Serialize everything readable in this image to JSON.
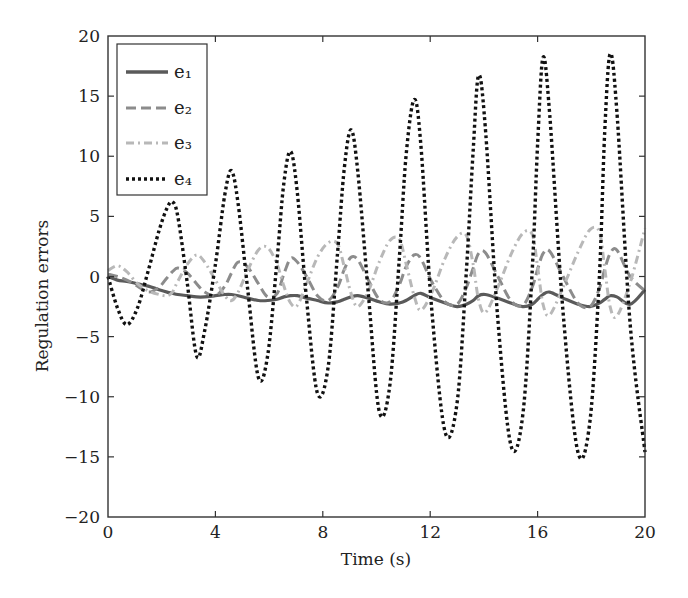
{
  "chart_data": {
    "type": "line",
    "title": "",
    "xlabel": "Time (s)",
    "ylabel": "Regulation errors",
    "xlim": [
      0,
      20
    ],
    "ylim": [
      -20,
      20
    ],
    "xticks": [
      0,
      4,
      8,
      12,
      16,
      20
    ],
    "yticks": [
      -20,
      -15,
      -10,
      -5,
      0,
      5,
      10,
      15,
      20
    ],
    "grid": false,
    "legend_position": "upper left",
    "x": [
      0,
      0.35,
      0.7,
      1.1,
      1.5,
      1.9,
      2.2,
      2.4,
      2.6,
      2.95,
      3.3,
      3.6,
      4.0,
      4.35,
      4.6,
      4.85,
      5.2,
      5.6,
      5.95,
      6.3,
      6.55,
      6.8,
      7.05,
      7.4,
      7.8,
      8.2,
      8.55,
      8.8,
      9.05,
      9.3,
      9.7,
      10.1,
      10.5,
      10.85,
      11.1,
      11.4,
      11.65,
      12.05,
      12.55,
      13.0,
      13.35,
      13.6,
      13.8,
      14.05,
      14.5,
      15.0,
      15.45,
      15.8,
      16.0,
      16.2,
      16.45,
      16.95,
      17.5,
      17.95,
      18.3,
      18.5,
      18.7,
      18.95,
      19.45,
      20.0
    ],
    "series": [
      {
        "name": "e1",
        "label": "e₁",
        "color": "#5a5a5a",
        "dash": "solid",
        "values": [
          0,
          -0.3,
          -0.4,
          -0.6,
          -0.8,
          -1.1,
          -1.3,
          -1.4,
          -1.5,
          -1.6,
          -1.7,
          -1.7,
          -1.6,
          -1.5,
          -1.5,
          -1.6,
          -1.8,
          -2.0,
          -2.0,
          -1.9,
          -1.7,
          -1.6,
          -1.6,
          -1.8,
          -2.0,
          -2.2,
          -2.1,
          -1.9,
          -1.7,
          -1.6,
          -1.8,
          -2.1,
          -2.3,
          -2.2,
          -2.0,
          -1.6,
          -1.4,
          -1.8,
          -2.2,
          -2.5,
          -2.3,
          -2.0,
          -1.6,
          -1.5,
          -1.8,
          -2.2,
          -2.5,
          -2.3,
          -1.9,
          -1.5,
          -1.3,
          -1.8,
          -2.3,
          -2.5,
          -2.2,
          -1.9,
          -1.6,
          -1.7,
          -2.3,
          -1.1
        ]
      },
      {
        "name": "e2",
        "label": "e₂",
        "color": "#8c8c8c",
        "dash": "dashed",
        "values": [
          0.2,
          0,
          -0.3,
          -0.8,
          -1.3,
          -0.9,
          -0.1,
          0.4,
          0.7,
          0.3,
          -0.6,
          -1.3,
          -1.6,
          -0.8,
          0.3,
          1.2,
          0.8,
          -0.6,
          -1.7,
          -1.4,
          0.2,
          1.5,
          1.2,
          0.0,
          -1.6,
          -2.0,
          -0.9,
          0.6,
          1.6,
          1.4,
          -0.3,
          -1.9,
          -2.1,
          -0.7,
          0.8,
          1.8,
          1.5,
          -0.4,
          -2.1,
          -2.3,
          -0.9,
          0.7,
          1.9,
          2.0,
          0.1,
          -2.0,
          -2.4,
          -0.9,
          0.6,
          1.9,
          2.1,
          0.0,
          -2.2,
          -2.5,
          -1.0,
          0.6,
          1.9,
          2.2,
          0.0,
          -1.2
        ]
      },
      {
        "name": "e3",
        "label": "e₃",
        "color": "#b8b8b8",
        "dash": "dashdot",
        "values": [
          0.5,
          0.9,
          0.4,
          -0.6,
          -1.2,
          -1.5,
          -1.6,
          -1.3,
          -0.4,
          1.0,
          1.8,
          1.2,
          -0.3,
          -1.6,
          -2.0,
          -1.3,
          0.5,
          2.2,
          2.4,
          1.0,
          -0.8,
          -2.2,
          -2.4,
          -0.6,
          1.6,
          2.8,
          2.7,
          0.8,
          -1.4,
          -2.5,
          -1.2,
          1.2,
          3.0,
          3.1,
          1.1,
          -1.6,
          -2.8,
          -1.4,
          1.5,
          3.3,
          3.4,
          1.0,
          -1.9,
          -3.0,
          -1.0,
          1.8,
          3.6,
          3.5,
          0.8,
          -2.3,
          -3.2,
          -0.9,
          2.0,
          3.9,
          3.7,
          0.7,
          -2.5,
          -3.3,
          -0.5,
          4.0
        ]
      },
      {
        "name": "e4",
        "label": "e₄",
        "color": "#111111",
        "dash": "dotted",
        "values": [
          0,
          -2.6,
          -4.0,
          -2.6,
          0.5,
          3.8,
          5.7,
          6.2,
          5.0,
          -0.5,
          -6.6,
          -4.5,
          1.0,
          6.8,
          8.8,
          6.0,
          -1.0,
          -8.4,
          -6.5,
          1.5,
          7.8,
          10.4,
          7.0,
          -2.0,
          -9.7,
          -7.5,
          2.0,
          9.0,
          12.2,
          8.8,
          -1.5,
          -11.2,
          -9.0,
          1.5,
          10.0,
          14.7,
          11.0,
          -2.5,
          -12.9,
          -10.5,
          0.5,
          10.5,
          16.7,
          12.5,
          -3.0,
          -14.0,
          -11.5,
          0.5,
          11.0,
          18.2,
          13.5,
          -3.0,
          -14.6,
          -12.0,
          0.0,
          12.0,
          18.5,
          13.8,
          -4.0,
          -14.6
        ]
      }
    ]
  },
  "legend": {
    "entries": [
      "e₁",
      "e₂",
      "e₃",
      "e₄"
    ]
  }
}
